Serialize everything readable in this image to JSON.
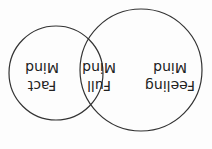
{
  "diagram": {
    "type": "venn",
    "orientation": "rotated-180",
    "circles": [
      {
        "id": "feeling",
        "label_line1": "Feeling",
        "label_line2": "Mind"
      },
      {
        "id": "fact",
        "label_line1": "Fact",
        "label_line2": "Mind"
      }
    ],
    "intersection": {
      "label_line1": "Full",
      "label_line2": "Mind"
    },
    "colors": {
      "stroke": "#333333",
      "text": "#222222",
      "background": "#fdfdfd"
    }
  }
}
